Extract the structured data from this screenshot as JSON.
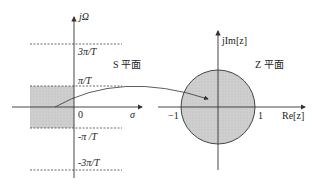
{
  "s_plane": {
    "title": "S 平面",
    "axis_vertical_label": "jΩ",
    "axis_horizontal_label": "σ",
    "origin_label": "0",
    "ticks": [
      "3π/T",
      "π/T",
      "-π /T",
      "-3π/T"
    ]
  },
  "z_plane": {
    "title": "Z 平面",
    "axis_vertical_label": "jIm[z]",
    "axis_horizontal_label": "Re[z]",
    "tick_neg": "−1",
    "tick_pos": "1"
  },
  "colors": {
    "shade": "#c8c8c8",
    "line": "#333333"
  }
}
